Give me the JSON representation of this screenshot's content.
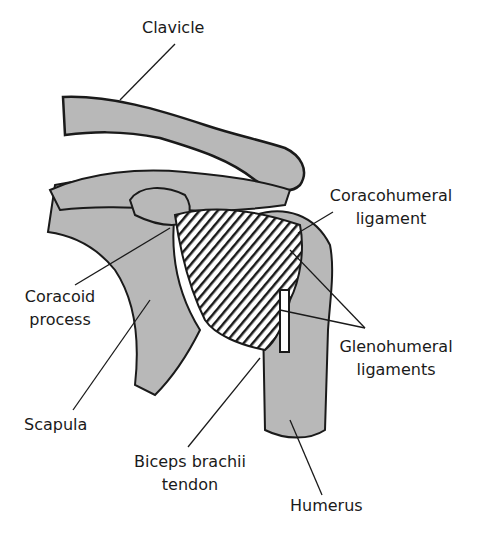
{
  "diagram": {
    "colors": {
      "bone": "#b8b8b8",
      "ink": "#1a1a1a",
      "background": "#ffffff",
      "ligament": "#ffffff"
    },
    "labels": {
      "clavicle": "Clavicle",
      "coracohumeral_1": "Coracohumeral",
      "coracohumeral_2": "ligament",
      "coracoid_1": "Coracoid",
      "coracoid_2": "process",
      "glenohumeral_1": "Glenohumeral",
      "glenohumeral_2": "ligaments",
      "scapula": "Scapula",
      "biceps_1": "Biceps brachii",
      "biceps_2": "tendon",
      "humerus": "Humerus"
    }
  }
}
